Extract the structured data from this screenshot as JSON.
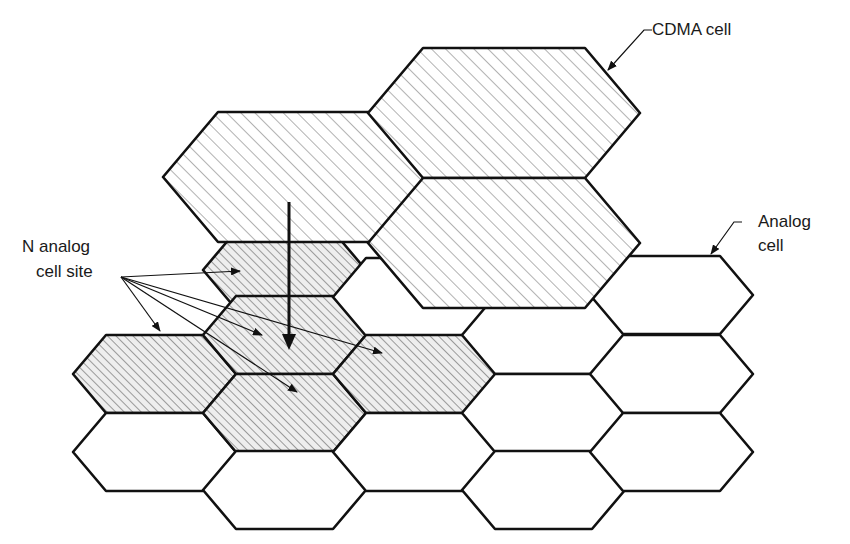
{
  "labels": {
    "cdma_cell": "CDMA cell",
    "analog_cell_line1": "Analog",
    "analog_cell_line2": "cell",
    "n_analog_line1": "N analog",
    "n_analog_line2": "cell site"
  },
  "colors": {
    "stroke": "#111111",
    "hatch": "#555555",
    "background": "#ffffff"
  },
  "geometry": {
    "analog_hex": {
      "width": 163,
      "inset": 33,
      "half_height": 39
    },
    "cdma_hex": {
      "width": 272,
      "inset": 55,
      "half_height": 65
    }
  },
  "analog_cells": [
    {
      "x": 73,
      "cy": 374,
      "shaded": true
    },
    {
      "x": 73,
      "cy": 452,
      "shaded": false
    },
    {
      "x": 203,
      "cy": 270,
      "shaded": true
    },
    {
      "x": 203,
      "cy": 335,
      "shaded": true
    },
    {
      "x": 203,
      "cy": 413,
      "shaded": true
    },
    {
      "x": 203,
      "cy": 490,
      "shaded": false
    },
    {
      "x": 333,
      "cy": 297,
      "shaded": false
    },
    {
      "x": 333,
      "cy": 374,
      "shaded": true
    },
    {
      "x": 333,
      "cy": 452,
      "shaded": false
    },
    {
      "x": 462,
      "cy": 335,
      "shaded": false
    },
    {
      "x": 462,
      "cy": 413,
      "shaded": false
    },
    {
      "x": 462,
      "cy": 490,
      "shaded": false
    },
    {
      "x": 590,
      "cy": 295,
      "shaded": false
    },
    {
      "x": 590,
      "cy": 374,
      "shaded": false
    },
    {
      "x": 590,
      "cy": 452,
      "shaded": false
    }
  ],
  "cdma_cells": [
    {
      "x": 163,
      "cy": 177
    },
    {
      "x": 368,
      "cy": 113
    },
    {
      "x": 368,
      "cy": 243
    }
  ],
  "site_arrows": {
    "origin": [
      121,
      277
    ],
    "targets": [
      [
        240,
        271
      ],
      [
        160,
        331
      ],
      [
        262,
        335
      ],
      [
        297,
        392
      ],
      [
        382,
        353
      ]
    ]
  },
  "main_arrow": {
    "from": [
      289,
      202
    ],
    "to": [
      289,
      350
    ]
  }
}
